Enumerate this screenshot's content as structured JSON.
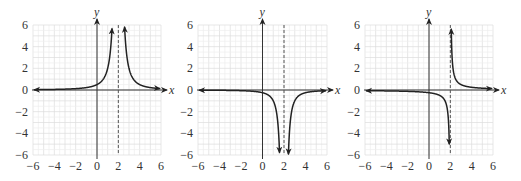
{
  "chart_data": [
    {
      "type": "line",
      "title": "",
      "xlabel": "x",
      "ylabel": "y",
      "xlim": [
        -6,
        6
      ],
      "ylim": [
        -6,
        6
      ],
      "xticks": [
        -6,
        -4,
        -2,
        0,
        2,
        4,
        6
      ],
      "yticks": [
        -6,
        -4,
        -2,
        0,
        2,
        4,
        6
      ],
      "xtick_labels": [
        "−6",
        "−4",
        "−2",
        "0",
        "2",
        "4",
        "6"
      ],
      "ytick_labels": [
        "6",
        "4",
        "2",
        "0",
        "−2",
        "−4",
        "−6"
      ],
      "grid": true,
      "vertical_asymptote": 2,
      "horizontal_asymptote": 0,
      "function": "2/(x-2)^2",
      "series": [
        {
          "name": "left branch",
          "x": [
            -6,
            -4,
            -2,
            0,
            1,
            1.5,
            1.42
          ],
          "y": [
            0.03,
            0.06,
            0.13,
            0.5,
            2,
            8,
            6
          ]
        },
        {
          "name": "right branch",
          "x": [
            2.58,
            3,
            4,
            6
          ],
          "y": [
            6,
            2,
            0.5,
            0.13
          ]
        }
      ],
      "box": {
        "left": 33,
        "right": 161,
        "top": 25,
        "bottom": 155
      }
    },
    {
      "type": "line",
      "title": "",
      "xlabel": "x",
      "ylabel": "y",
      "xlim": [
        -6,
        6
      ],
      "ylim": [
        -6,
        6
      ],
      "xticks": [
        -6,
        -4,
        -2,
        0,
        2,
        4,
        6
      ],
      "yticks": [
        -6,
        -4,
        -2,
        0,
        2,
        4,
        6
      ],
      "xtick_labels": [
        "−6",
        "−4",
        "−2",
        "0",
        "2",
        "4",
        "6"
      ],
      "ytick_labels": [
        "6",
        "4",
        "2",
        "0",
        "−2",
        "−4",
        "−6"
      ],
      "grid": true,
      "vertical_asymptote": 2,
      "horizontal_asymptote": 0,
      "function": "-1/(x-2)^2",
      "series": [
        {
          "name": "left branch",
          "x": [
            -6,
            -4,
            -2,
            0,
            1,
            1.59
          ],
          "y": [
            -0.02,
            -0.03,
            -0.06,
            -0.25,
            -1,
            -6
          ]
        },
        {
          "name": "right branch",
          "x": [
            2.41,
            3,
            4,
            6
          ],
          "y": [
            -6,
            -1,
            -0.25,
            -0.06
          ]
        }
      ],
      "box": {
        "left": 198,
        "right": 327,
        "top": 25,
        "bottom": 155
      }
    },
    {
      "type": "line",
      "title": "",
      "xlabel": "x",
      "ylabel": "y",
      "xlim": [
        -6,
        6
      ],
      "ylim": [
        -6,
        6
      ],
      "xticks": [
        -6,
        -4,
        -2,
        0,
        2,
        4,
        6
      ],
      "yticks": [
        -6,
        -4,
        -2,
        0,
        2,
        4,
        6
      ],
      "xtick_labels": [
        "−6",
        "−4",
        "−2",
        "0",
        "2",
        "4",
        "6"
      ],
      "ytick_labels": [
        "6",
        "4",
        "2",
        "0",
        "−2",
        "−4",
        "−6"
      ],
      "grid": true,
      "vertical_asymptote": 2,
      "horizontal_asymptote": 0,
      "function": "0.5/(x-2)",
      "series": [
        {
          "name": "left branch",
          "x": [
            -6,
            -4,
            -2,
            0,
            1,
            1.92
          ],
          "y": [
            -0.06,
            -0.08,
            -0.13,
            -0.25,
            -0.5,
            -6
          ]
        },
        {
          "name": "right branch",
          "x": [
            2.08,
            3,
            4,
            6
          ],
          "y": [
            6,
            0.5,
            0.25,
            0.13
          ]
        }
      ],
      "box": {
        "left": 365,
        "right": 493,
        "top": 25,
        "bottom": 155
      }
    }
  ],
  "charts": [
    {
      "id": "graph-a",
      "fn": "sq_pos",
      "k": 2
    },
    {
      "id": "graph-b",
      "fn": "sq_neg",
      "k": 1
    },
    {
      "id": "graph-c",
      "fn": "recip",
      "k": 0.5
    }
  ]
}
